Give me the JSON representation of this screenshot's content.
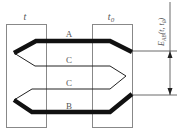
{
  "diagram": {
    "type": "thermocouple",
    "junctions": {
      "hot": "t",
      "cold": "t",
      "cold_subscript": "0"
    },
    "conductors": {
      "top": "A",
      "middle_upper": "C",
      "middle_lower": "C",
      "bottom": "B"
    },
    "emf": {
      "symbol": "E",
      "subscript": "AB",
      "args": "(t, t",
      "args_subscript": "0",
      "close": ")"
    }
  }
}
